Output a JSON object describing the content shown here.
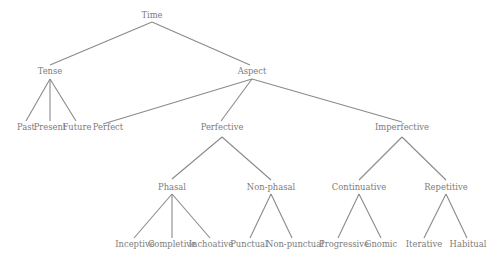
{
  "diagram": {
    "type": "tree",
    "title": "Time",
    "colors": {
      "text": "#7c7c7c",
      "edge": "#8a8a8a",
      "background": "#ffffff"
    },
    "nodes": [
      {
        "id": "time",
        "label": "Time",
        "x": 152,
        "y": 18
      },
      {
        "id": "tense",
        "label": "Tense",
        "x": 50,
        "y": 74
      },
      {
        "id": "aspect",
        "label": "Aspect",
        "x": 252,
        "y": 74
      },
      {
        "id": "past",
        "label": "Past",
        "x": 26,
        "y": 130
      },
      {
        "id": "present",
        "label": "Present",
        "x": 50,
        "y": 130
      },
      {
        "id": "future",
        "label": "Future",
        "x": 77,
        "y": 130
      },
      {
        "id": "perfect",
        "label": "Perfect",
        "x": 108,
        "y": 130
      },
      {
        "id": "perfective",
        "label": "Perfective",
        "x": 222,
        "y": 130
      },
      {
        "id": "imperfective",
        "label": "Imperfective",
        "x": 402,
        "y": 130
      },
      {
        "id": "phasal",
        "label": "Phasal",
        "x": 172,
        "y": 190
      },
      {
        "id": "non-phasal",
        "label": "Non-phasal",
        "x": 271,
        "y": 190
      },
      {
        "id": "continuative",
        "label": "Continuative",
        "x": 359,
        "y": 190
      },
      {
        "id": "repetitive",
        "label": "Repetitive",
        "x": 446,
        "y": 190
      },
      {
        "id": "inceptive",
        "label": "Inceptive",
        "x": 135,
        "y": 247
      },
      {
        "id": "completive",
        "label": "Completive",
        "x": 172,
        "y": 247
      },
      {
        "id": "inchoative",
        "label": "Inchoative",
        "x": 211,
        "y": 247
      },
      {
        "id": "punctual",
        "label": "Punctual",
        "x": 249,
        "y": 247
      },
      {
        "id": "non-punctual",
        "label": "Non-punctual",
        "x": 295,
        "y": 247
      },
      {
        "id": "progressive",
        "label": "Progressive",
        "x": 344,
        "y": 247
      },
      {
        "id": "gnomic",
        "label": "Gnomic",
        "x": 381,
        "y": 247
      },
      {
        "id": "iterative",
        "label": "Iterative",
        "x": 424,
        "y": 247
      },
      {
        "id": "habitual",
        "label": "Habitual",
        "x": 468,
        "y": 247
      }
    ],
    "edges": [
      {
        "from": "time",
        "to": "tense",
        "x1": 152,
        "y1": 22,
        "x2": 50,
        "y2": 65
      },
      {
        "from": "time",
        "to": "aspect",
        "x1": 152,
        "y1": 22,
        "x2": 250,
        "y2": 65
      },
      {
        "from": "tense",
        "to": "past",
        "x1": 50,
        "y1": 79,
        "x2": 26,
        "y2": 121
      },
      {
        "from": "tense",
        "to": "present",
        "x1": 50,
        "y1": 79,
        "x2": 50,
        "y2": 121
      },
      {
        "from": "tense",
        "to": "future",
        "x1": 50,
        "y1": 79,
        "x2": 76,
        "y2": 121
      },
      {
        "from": "aspect",
        "to": "perfect",
        "x1": 252,
        "y1": 79,
        "x2": 103,
        "y2": 124
      },
      {
        "from": "aspect",
        "to": "perfective",
        "x1": 252,
        "y1": 79,
        "x2": 221,
        "y2": 121
      },
      {
        "from": "aspect",
        "to": "imperfective",
        "x1": 252,
        "y1": 79,
        "x2": 402,
        "y2": 122
      },
      {
        "from": "perfective",
        "to": "phasal",
        "x1": 222,
        "y1": 137,
        "x2": 172,
        "y2": 179
      },
      {
        "from": "perfective",
        "to": "non-phasal",
        "x1": 222,
        "y1": 137,
        "x2": 271,
        "y2": 180
      },
      {
        "from": "imperfective",
        "to": "continuative",
        "x1": 402,
        "y1": 137,
        "x2": 359,
        "y2": 180
      },
      {
        "from": "imperfective",
        "to": "repetitive",
        "x1": 402,
        "y1": 137,
        "x2": 446,
        "y2": 180
      },
      {
        "from": "phasal",
        "to": "inceptive",
        "x1": 172,
        "y1": 194,
        "x2": 134,
        "y2": 238
      },
      {
        "from": "phasal",
        "to": "completive",
        "x1": 172,
        "y1": 194,
        "x2": 172,
        "y2": 238
      },
      {
        "from": "phasal",
        "to": "inchoative",
        "x1": 172,
        "y1": 194,
        "x2": 210,
        "y2": 238
      },
      {
        "from": "non-phasal",
        "to": "punctual",
        "x1": 271,
        "y1": 194,
        "x2": 250,
        "y2": 238
      },
      {
        "from": "non-phasal",
        "to": "non-punctual",
        "x1": 271,
        "y1": 194,
        "x2": 292,
        "y2": 238
      },
      {
        "from": "continuative",
        "to": "progressive",
        "x1": 359,
        "y1": 194,
        "x2": 338,
        "y2": 238
      },
      {
        "from": "continuative",
        "to": "gnomic",
        "x1": 359,
        "y1": 194,
        "x2": 381,
        "y2": 238
      },
      {
        "from": "repetitive",
        "to": "iterative",
        "x1": 446,
        "y1": 194,
        "x2": 424,
        "y2": 238
      },
      {
        "from": "repetitive",
        "to": "habitual",
        "x1": 446,
        "y1": 194,
        "x2": 467,
        "y2": 238
      }
    ]
  }
}
